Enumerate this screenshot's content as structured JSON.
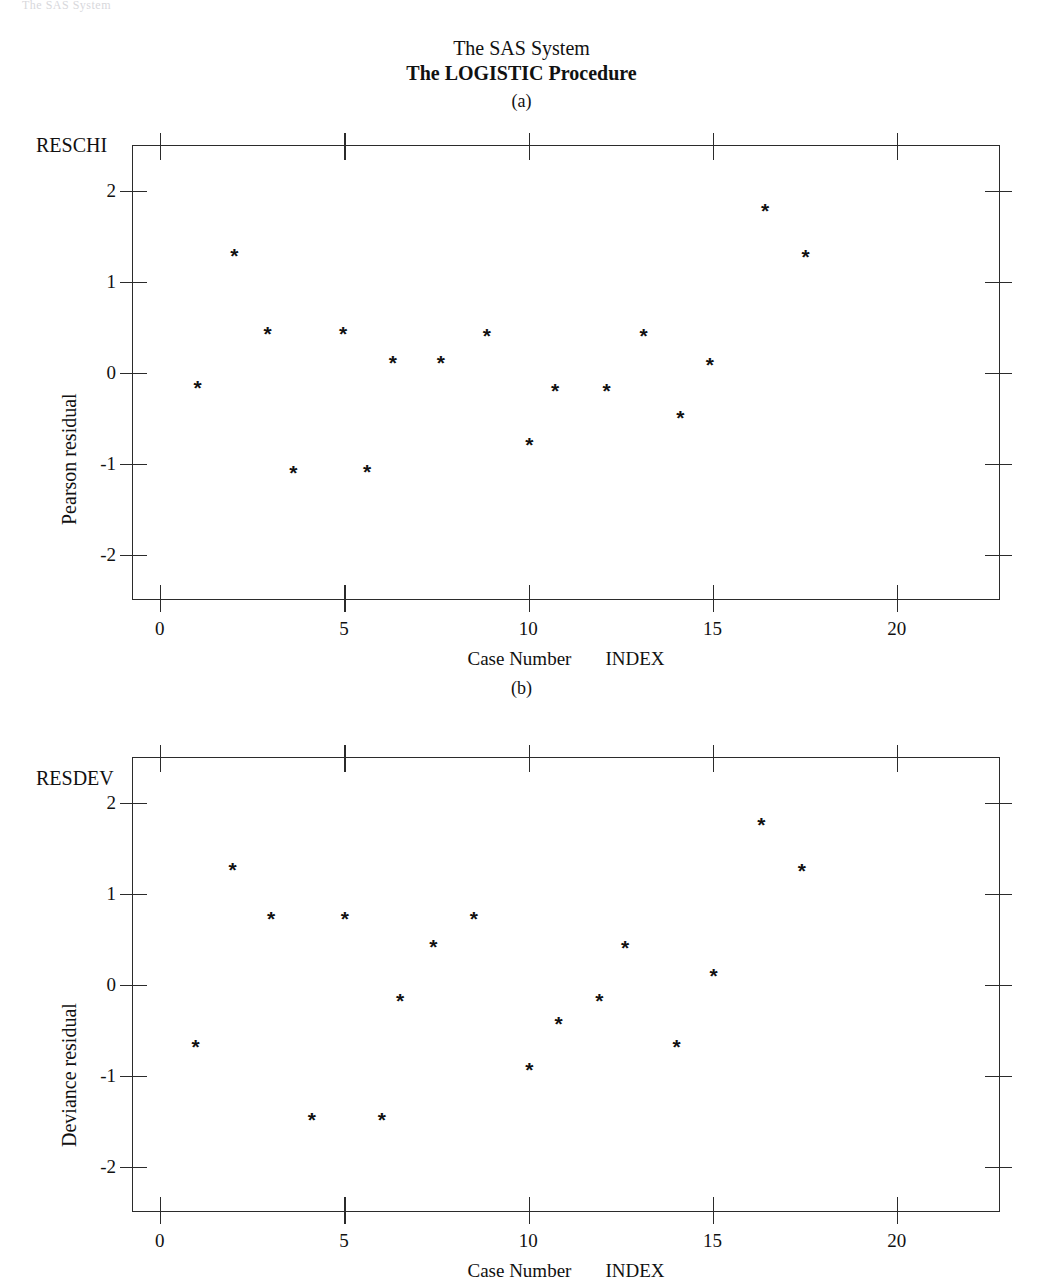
{
  "page": {
    "bleed_text": "The SAS System",
    "title_line1": "The SAS System",
    "title_line2": "The LOGISTIC Procedure",
    "ink_color": "#111111",
    "frame_color": "#2b2b2b",
    "background": "#ffffff"
  },
  "panels": [
    {
      "tag": "(a)",
      "var_name": "RESCHI",
      "y_title": "Deviance residual",
      "x_title_left": "Case Number",
      "x_title_right": "INDEX"
    },
    {
      "tag": "(b)",
      "var_name": "RESDEV",
      "y_title": "Deviance residual",
      "x_title_left": "Case Number",
      "x_title_right": "INDEX"
    }
  ],
  "chart_data": [
    {
      "type": "scatter",
      "title": "(a)",
      "variable": "RESCHI",
      "xlabel": "Case Number    INDEX",
      "ylabel": "Pearson residual",
      "xlim": [
        -0.75,
        22.8
      ],
      "ylim": [
        -2.5,
        2.5
      ],
      "xticks": [
        0,
        5,
        10,
        15,
        20
      ],
      "xtick_labels": [
        "0",
        "5",
        "10",
        "15",
        "20"
      ],
      "yticks": [
        2,
        1,
        0,
        -1,
        -2
      ],
      "ytick_labels": [
        "2",
        "1",
        "0",
        "-1",
        "-2"
      ],
      "grid": false,
      "legend": null,
      "marker": "*",
      "marker_color": "#111111",
      "x": [
        1.0,
        2.0,
        2.9,
        3.6,
        4.95,
        5.6,
        6.3,
        7.6,
        8.85,
        10.0,
        10.7,
        12.1,
        13.1,
        14.1,
        14.9,
        16.4,
        17.5
      ],
      "y": [
        -0.15,
        1.3,
        0.45,
        -1.08,
        0.44,
        -1.07,
        0.13,
        0.13,
        0.42,
        -0.77,
        -0.18,
        -0.18,
        0.42,
        -0.48,
        0.1,
        1.8,
        1.29
      ]
    },
    {
      "type": "scatter",
      "title": "(b)",
      "variable": "RESDEV",
      "xlabel": "Case Number    INDEX",
      "ylabel": "Deviance residual",
      "xlim": [
        -0.75,
        22.8
      ],
      "ylim": [
        -2.5,
        2.5
      ],
      "xticks": [
        0,
        5,
        10,
        15,
        20
      ],
      "xtick_labels": [
        "0",
        "5",
        "10",
        "15",
        "20"
      ],
      "yticks": [
        2,
        1,
        0,
        -1,
        -2
      ],
      "ytick_labels": [
        "2",
        "1",
        "0",
        "-1",
        "-2"
      ],
      "grid": false,
      "legend": null,
      "marker": "*",
      "marker_color": "#111111",
      "x": [
        0.95,
        1.95,
        3.0,
        4.1,
        5.0,
        6.0,
        6.5,
        7.4,
        8.5,
        10.0,
        10.8,
        11.9,
        12.6,
        14.0,
        15.0,
        16.3,
        17.4
      ],
      "y": [
        -0.67,
        1.28,
        0.74,
        -1.47,
        0.74,
        -1.47,
        -0.16,
        0.43,
        0.74,
        -0.92,
        -0.41,
        -0.16,
        0.42,
        -0.67,
        0.11,
        1.78,
        1.27
      ]
    }
  ]
}
